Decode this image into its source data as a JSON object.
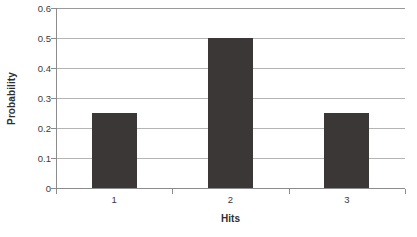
{
  "chart_data": {
    "type": "bar",
    "title": "",
    "categories": [
      "1",
      "2",
      "3"
    ],
    "values": [
      0.25,
      0.5,
      0.25
    ],
    "series": [
      {
        "name": "Probability",
        "values": [
          0.25,
          0.5,
          0.25
        ]
      }
    ],
    "xlabel": "Hits",
    "ylabel": "Probability",
    "ylim": [
      0,
      0.6
    ],
    "ytick_labels": [
      "0",
      "0.1",
      "0.2",
      "0.3",
      "0.4",
      "0.5",
      "0.6"
    ],
    "ytick_values": [
      0,
      0.1,
      0.2,
      0.3,
      0.4,
      0.5,
      0.6
    ],
    "grid": true,
    "legend": false,
    "bar_color": "#3b3737",
    "gridline_color": "#b4b4b4",
    "axis_color": "#8c8c8c",
    "background_color": "#ffffff"
  }
}
